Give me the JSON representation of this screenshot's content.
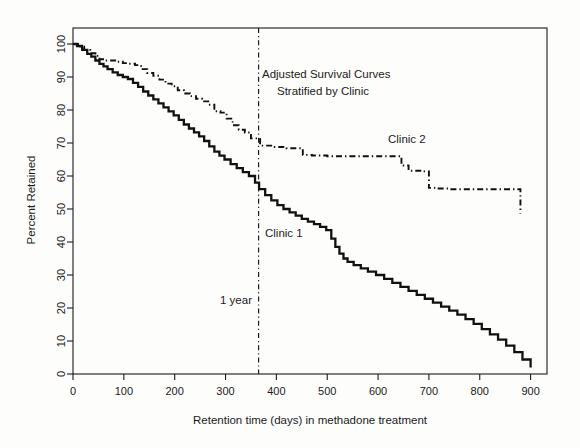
{
  "figure": {
    "background_color": "#fdfdfc",
    "ink_color": "#111111"
  },
  "annotations": {
    "title_line1": "Adjusted Survival Curves",
    "title_line2": "Stratified by Clinic",
    "clinic1_label": "Clinic 1",
    "clinic2_label": "Clinic 2",
    "one_year_label": "1 year"
  },
  "axes": {
    "xlabel": "Retention time (days) in methadone treatment",
    "ylabel": "Percent Retained",
    "xticks": [
      "0",
      "100",
      "200",
      "300",
      "400",
      "500",
      "600",
      "700",
      "800",
      "900"
    ],
    "yticks": [
      "0",
      "10",
      "20",
      "30",
      "40",
      "50",
      "60",
      "70",
      "80",
      "90",
      "100"
    ]
  },
  "chart_data": {
    "type": "line",
    "title": "Adjusted Survival Curves Stratified by Clinic",
    "subtitle": "Stratified by Clinic",
    "xlabel": "Retention time (days) in methadone treatment",
    "ylabel": "Percent Retained",
    "xlim": [
      0,
      930
    ],
    "ylim": [
      0,
      103
    ],
    "xticks": [
      0,
      100,
      200,
      300,
      400,
      500,
      600,
      700,
      800,
      900
    ],
    "yticks": [
      0,
      10,
      20,
      30,
      40,
      50,
      60,
      70,
      80,
      90,
      100
    ],
    "grid": false,
    "legend": "inline-labels",
    "step_type": "post",
    "annotations": [
      {
        "text": "Adjusted Survival Curves",
        "x": 370,
        "y": 86
      },
      {
        "text": "Stratified by Clinic",
        "x": 400,
        "y": 79
      },
      {
        "text": "Clinic 1",
        "x": 400,
        "y": 43
      },
      {
        "text": "Clinic 2",
        "x": 680,
        "y": 64
      },
      {
        "text": "1 year",
        "x": 330,
        "y": 19
      }
    ],
    "reference_lines": [
      {
        "orientation": "vertical",
        "x": 365,
        "label": "1 year",
        "style": "dashdot"
      }
    ],
    "series": [
      {
        "name": "Clinic 1",
        "style": "solid",
        "label_x": 400,
        "label_y": 43,
        "x": [
          0,
          8,
          18,
          28,
          36,
          44,
          52,
          60,
          68,
          78,
          88,
          98,
          108,
          118,
          128,
          138,
          148,
          158,
          168,
          178,
          188,
          198,
          208,
          218,
          228,
          238,
          248,
          258,
          268,
          278,
          288,
          298,
          310,
          322,
          334,
          346,
          358,
          366,
          378,
          390,
          402,
          414,
          426,
          438,
          450,
          462,
          474,
          486,
          498,
          508,
          516,
          524,
          532,
          540,
          552,
          566,
          580,
          596,
          612,
          628,
          644,
          660,
          676,
          692,
          708,
          724,
          740,
          756,
          772,
          788,
          804,
          820,
          836,
          852,
          868,
          884,
          900
        ],
        "y": [
          100,
          99.4,
          98.2,
          97.0,
          96.2,
          95.0,
          94.0,
          93.2,
          92.4,
          91.4,
          90.6,
          90.0,
          89.4,
          88.2,
          87.0,
          85.6,
          84.4,
          83.2,
          82.0,
          80.8,
          79.6,
          78.4,
          77.0,
          75.6,
          74.4,
          73.2,
          72.0,
          70.6,
          69.0,
          67.4,
          66.2,
          65.0,
          63.6,
          62.4,
          61.2,
          60.0,
          58.0,
          56.0,
          54.2,
          52.6,
          51.2,
          50.0,
          49.0,
          48.0,
          47.0,
          46.2,
          45.4,
          44.6,
          43.6,
          41.0,
          38.5,
          36.5,
          35.0,
          34.0,
          33.0,
          32.0,
          31.0,
          30.0,
          28.8,
          27.6,
          26.4,
          25.2,
          24.0,
          22.8,
          21.6,
          20.4,
          19.2,
          18.0,
          16.6,
          15.2,
          13.6,
          12.0,
          10.4,
          8.6,
          6.6,
          4.4,
          2.0
        ]
      },
      {
        "name": "Clinic 2",
        "style": "dashdot",
        "label_x": 680,
        "label_y": 64,
        "x": [
          0,
          10,
          22,
          34,
          44,
          52,
          62,
          74,
          86,
          98,
          110,
          122,
          134,
          146,
          158,
          170,
          182,
          194,
          206,
          218,
          230,
          242,
          254,
          266,
          278,
          290,
          302,
          314,
          326,
          338,
          350,
          362,
          368,
          395,
          420,
          452,
          470,
          500,
          530,
          566,
          600,
          630,
          646,
          660,
          686,
          700,
          716,
          740,
          780,
          820,
          860,
          875,
          880
        ],
        "y": [
          100,
          99.2,
          98.2,
          97.2,
          96.4,
          95.4,
          95.0,
          95.0,
          94.6,
          94.2,
          94.0,
          93.6,
          92.4,
          91.2,
          90.4,
          89.2,
          88.0,
          87.2,
          86.0,
          85.0,
          84.2,
          83.4,
          82.6,
          81.6,
          79.6,
          79.2,
          77.4,
          75.4,
          74.0,
          73.2,
          71.4,
          71.2,
          69.2,
          68.8,
          68.4,
          66.4,
          66.2,
          66.0,
          66.0,
          66.0,
          66.0,
          66.0,
          63.2,
          61.6,
          61.4,
          56.4,
          56.2,
          56.0,
          56.0,
          56.0,
          56.0,
          56.0,
          48.6
        ]
      }
    ]
  }
}
